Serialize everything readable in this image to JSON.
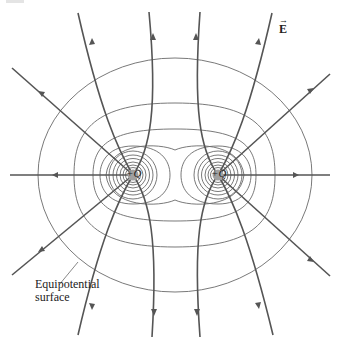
{
  "figure": {
    "field_label": "E",
    "field_vector_symbol": "→",
    "charges": [
      {
        "label": "+Q",
        "x": 133,
        "y": 175
      },
      {
        "label": "+Q",
        "x": 218,
        "y": 175
      }
    ],
    "callout": {
      "line1": "Equipotential",
      "line2": "surface"
    },
    "colors": {
      "field_line": "#555555",
      "equipotential": "#6a6a6a",
      "charge_fill": "#a0a0a0",
      "background": "#ffffff"
    }
  }
}
